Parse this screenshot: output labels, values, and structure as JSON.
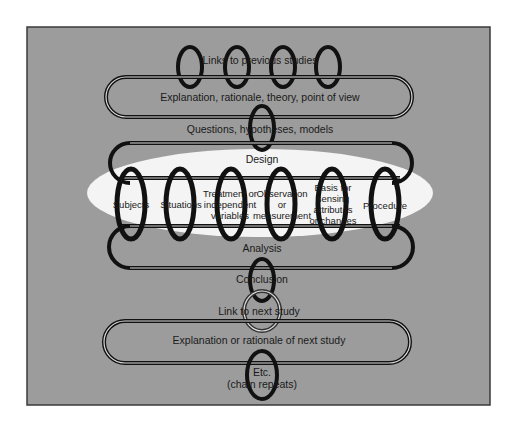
{
  "diagram": {
    "colors": {
      "panel": "#9c9c9c",
      "panel_border": "#3a3a3a",
      "ellipse": "#f4f4f4",
      "ring_dark": "#111111",
      "ring_light": "#e6e6e6",
      "text": "#1a1a1a"
    },
    "nodes": {
      "links_previous": "Links to previous studies",
      "explanation": "Explanation, rationale, theory, point of view",
      "questions": "Questions, hypotheses, models",
      "design": "Design",
      "design_elements": [
        {
          "lines": [
            "Subjects"
          ]
        },
        {
          "lines": [
            "Situations"
          ]
        },
        {
          "lines": [
            "Treatment or",
            "independent",
            "variables"
          ]
        },
        {
          "lines": [
            "Observation",
            "or",
            "measurement"
          ]
        },
        {
          "lines": [
            "Basis for",
            "sensing",
            "attributes",
            "or changes"
          ]
        },
        {
          "lines": [
            "Procedure"
          ]
        }
      ],
      "analysis": "Analysis",
      "conclusion": "Conclusion",
      "link_next": "Link to next study",
      "explanation_next": "Explanation or rationale of next study",
      "etc": [
        "Etc.",
        "(chain repeats)"
      ]
    }
  }
}
